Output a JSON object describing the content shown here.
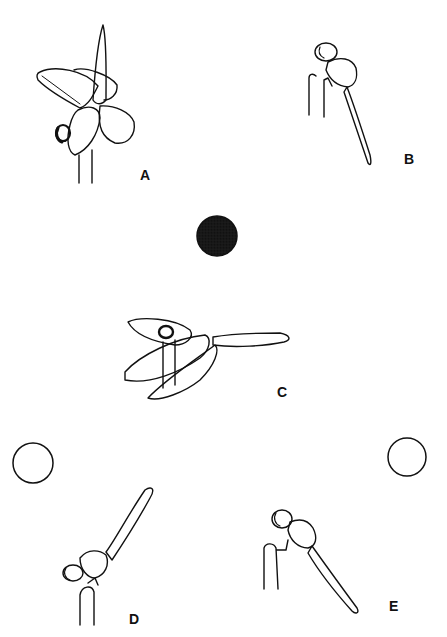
{
  "figure": {
    "panels": [
      {
        "id": "A",
        "label": "A",
        "posture": "obelisk with wings drooped forward, abdomen vertical",
        "sun": "none"
      },
      {
        "id": "B",
        "label": "B",
        "posture": "perched, abdomen hanging down",
        "sun": "none"
      },
      {
        "id": "C",
        "label": "C",
        "posture": "wings lowered, abdomen horizontal",
        "sun": "overhead, shaded (stippled)"
      },
      {
        "id": "D",
        "label": "D",
        "posture": "abdomen raised toward sun",
        "sun": "left, open circle"
      },
      {
        "id": "E",
        "label": "E",
        "posture": "abdomen lowered away from sun",
        "sun": "right, open circle"
      }
    ],
    "suns": [
      {
        "name": "stippled-sun",
        "style": "stippled"
      },
      {
        "name": "sun-left",
        "style": "open"
      },
      {
        "name": "sun-right",
        "style": "open"
      }
    ],
    "colors": {
      "ink": "#111111",
      "background": "#ffffff",
      "stipple": "#555555"
    }
  }
}
